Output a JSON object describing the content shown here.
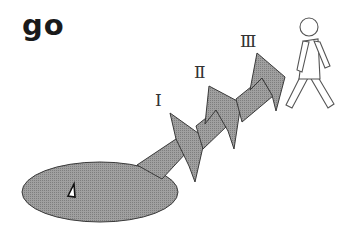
{
  "title": "go",
  "stages": [
    {
      "label": "Ⅰ"
    },
    {
      "label": "Ⅱ"
    },
    {
      "label": "Ⅲ"
    }
  ],
  "colors": {
    "fill": "#9a9a9a",
    "stroke": "#3a3a3a",
    "figure_stroke": "#555555",
    "background": "#ffffff"
  },
  "elements": {
    "start_area": "oval",
    "marker": "triangle-marker",
    "goal": "walking-person"
  }
}
